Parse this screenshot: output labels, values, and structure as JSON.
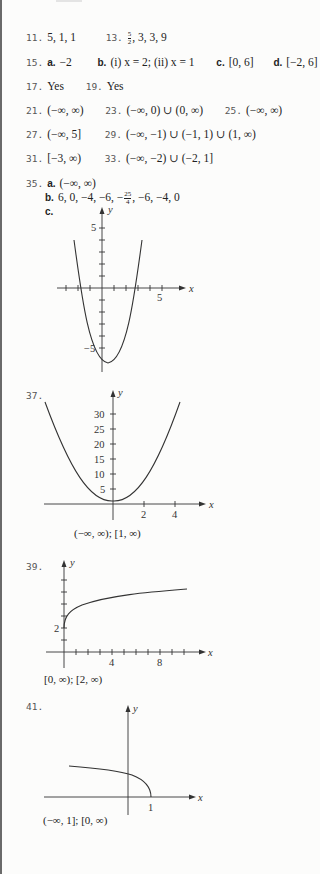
{
  "answers": [
    {
      "num": "11.",
      "text": "5, 1, 1"
    },
    {
      "num": "13.",
      "frac": {
        "n": "5",
        "d": "2"
      },
      "text": ", 3, 3, 9"
    },
    {
      "num": "15.",
      "parts": [
        {
          "label": "a.",
          "text": "−2"
        },
        {
          "label": "b.",
          "text": "(i) x = 2; (ii) x = 1"
        },
        {
          "label": "c.",
          "text": "[0, 6]"
        },
        {
          "label": "d.",
          "text": "[−2, 6]"
        }
      ]
    },
    {
      "num": "17.",
      "text": "Yes"
    },
    {
      "num": "19.",
      "text": "Yes"
    },
    {
      "num": "21.",
      "text": "(−∞, ∞)"
    },
    {
      "num": "23.",
      "text": "(−∞, 0) ∪ (0, ∞)"
    },
    {
      "num": "25.",
      "text": "(−∞, ∞)"
    },
    {
      "num": "27.",
      "text": "(−∞, 5]"
    },
    {
      "num": "29.",
      "text": "(−∞, −1) ∪ (−1, 1) ∪ (1, ∞)"
    },
    {
      "num": "31.",
      "text": "[−3, ∞)"
    },
    {
      "num": "33.",
      "text": "(−∞, −2) ∪ (−2, 1]"
    },
    {
      "num": "35.",
      "parts": [
        {
          "label": "a.",
          "text": "(−∞, ∞)"
        },
        {
          "label": "b.",
          "pre": "6, 0, −4, −6, −",
          "frac": {
            "n": "25",
            "d": "4"
          },
          "post": ", −6, −4, 0"
        },
        {
          "label": "c.",
          "text": ""
        }
      ]
    },
    {
      "num": "37.",
      "caption": "(−∞, ∞);   [1, ∞)"
    },
    {
      "num": "39.",
      "caption": "[0, ∞);   [2, ∞)"
    },
    {
      "num": "41.",
      "caption": "(−∞, 1];   [0, ∞)"
    }
  ],
  "graphs": {
    "g35": {
      "x_label": "x",
      "y_label": "y",
      "x_tick_label": "5",
      "y_tick_labels": [
        "5",
        "−5"
      ],
      "function": "y = x² − x − 6"
    },
    "g37": {
      "x_label": "x",
      "y_label": "y",
      "x_tick_labels": [
        "2",
        "4"
      ],
      "y_tick_labels": [
        "5",
        "10",
        "15",
        "20",
        "25",
        "30"
      ],
      "function": "y = 2x² + 1"
    },
    "g39": {
      "x_label": "x",
      "y_label": "y",
      "x_tick_labels": [
        "4",
        "8"
      ],
      "y_tick_labels": [
        "2"
      ],
      "function": "y = √x + 2"
    },
    "g41": {
      "x_label": "x",
      "y_label": "y",
      "x_tick_labels": [
        "1"
      ],
      "function": "y = √(1 − x)"
    }
  }
}
